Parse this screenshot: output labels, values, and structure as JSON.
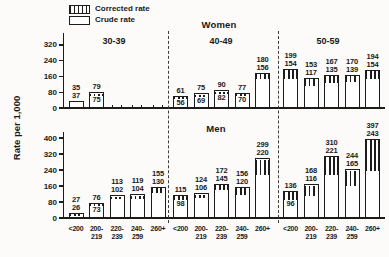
{
  "chart_data": {
    "type": "bar",
    "ylabel": "Rate per 1,000",
    "legend_items": [
      {
        "label": "Corrected rate",
        "style": "hatched"
      },
      {
        "label": "Crude rate",
        "style": "open"
      }
    ],
    "x_categories": [
      "<200",
      "200-219",
      "220-239",
      "240-259",
      "260+"
    ],
    "x_category_lines": [
      [
        "<200"
      ],
      [
        "200-",
        "219"
      ],
      [
        "220-",
        "239"
      ],
      [
        "240-",
        "259"
      ],
      [
        "260+"
      ]
    ],
    "sections": [
      {
        "group": "Women",
        "yticks": [
          0,
          80,
          160,
          240,
          320
        ],
        "ylim": [
          0,
          360
        ],
        "panels": [
          {
            "age": "30-39",
            "bars": [
              {
                "corrected": 35,
                "crude": 37,
                "crude_inside": false
              },
              {
                "corrected": 79,
                "crude": 75,
                "crude_inside": true
              },
              {
                "stub": true
              },
              {
                "stub": true
              },
              {
                "stub": true
              }
            ]
          },
          {
            "age": "40-49",
            "bars": [
              {
                "corrected": 61,
                "crude": 56,
                "crude_inside": true
              },
              {
                "corrected": 75,
                "crude": 69,
                "crude_inside": true
              },
              {
                "corrected": 90,
                "crude": 82,
                "crude_inside": true
              },
              {
                "corrected": 77,
                "crude": 70,
                "crude_inside": true
              },
              {
                "corrected": 180,
                "crude": 156,
                "crude_inside": false
              }
            ]
          },
          {
            "age": "50-59",
            "bars": [
              {
                "corrected": 199,
                "crude": 154,
                "crude_inside": false
              },
              {
                "corrected": 153,
                "crude": 117,
                "crude_inside": false
              },
              {
                "corrected": 167,
                "crude": 135,
                "crude_inside": false
              },
              {
                "corrected": 170,
                "crude": 139,
                "crude_inside": false
              },
              {
                "corrected": 194,
                "crude": 154,
                "crude_inside": false
              }
            ]
          }
        ]
      },
      {
        "group": "Men",
        "yticks": [
          0,
          80,
          160,
          240,
          320,
          400
        ],
        "ylim": [
          0,
          440
        ],
        "panels": [
          {
            "age": "30-39",
            "bars": [
              {
                "corrected": 27,
                "crude": 26,
                "crude_inside": false
              },
              {
                "corrected": 76,
                "crude": 73,
                "crude_inside": true
              },
              {
                "corrected": 113,
                "crude": 102,
                "crude_inside": false
              },
              {
                "corrected": 119,
                "crude": 104,
                "crude_inside": false
              },
              {
                "corrected": 155,
                "crude": 130,
                "crude_inside": false
              }
            ]
          },
          {
            "age": "40-49",
            "bars": [
              {
                "corrected": 115,
                "crude": 98,
                "crude_inside": true
              },
              {
                "corrected": 124,
                "crude": 106,
                "crude_inside": false
              },
              {
                "corrected": 172,
                "crude": 145,
                "crude_inside": false
              },
              {
                "corrected": 156,
                "crude": 120,
                "crude_inside": false
              },
              {
                "corrected": 299,
                "crude": 220,
                "crude_inside": false
              }
            ]
          },
          {
            "age": "50-59",
            "bars": [
              {
                "corrected": 136,
                "crude": 96,
                "crude_inside": true
              },
              {
                "corrected": 168,
                "crude": 116,
                "crude_inside": false
              },
              {
                "corrected": 310,
                "crude": 221,
                "crude_inside": false
              },
              {
                "corrected": 244,
                "crude": 165,
                "crude_inside": false
              },
              {
                "corrected": 397,
                "crude": 243,
                "crude_inside": false
              }
            ]
          }
        ]
      }
    ],
    "colors": {
      "ink": "#1c1c1c",
      "bar_fill": "#ffffff",
      "background": "#fcfbf9"
    },
    "layout": {
      "grid": false,
      "legend_position": "top-left",
      "panel_separator": "dashed"
    }
  }
}
